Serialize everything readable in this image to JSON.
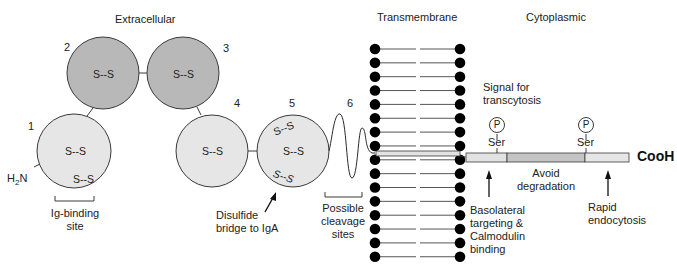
{
  "regions": {
    "extracellular": "Extracellular",
    "transmembrane": "Transmembrane",
    "cytoplasmic": "Cytoplasmic"
  },
  "domains": [
    {
      "number": "1",
      "bonds": [
        "S--S",
        "S--S"
      ],
      "shade": "light"
    },
    {
      "number": "2",
      "bonds": [
        "S--S"
      ],
      "shade": "dark"
    },
    {
      "number": "3",
      "bonds": [
        "S--S"
      ],
      "shade": "dark"
    },
    {
      "number": "4",
      "bonds": [
        "S--S"
      ],
      "shade": "light"
    },
    {
      "number": "5",
      "bonds": [
        "S--S",
        "S--S",
        "S--S"
      ],
      "shade": "light"
    },
    {
      "number": "6",
      "bonds": [],
      "shade": "none"
    }
  ],
  "labels": {
    "n_terminus": "H",
    "n_terminus_sub": "2",
    "n_terminus_tail": "N",
    "ig_binding_1": "Ig-binding",
    "ig_binding_2": "site",
    "disulfide_1": "Disulfide",
    "disulfide_2": "bridge to IgA",
    "cleavage_1": "Possible",
    "cleavage_2": "cleavage",
    "cleavage_3": "sites",
    "signal_1": "Signal for",
    "signal_2": "transcytosis",
    "phospho": "P",
    "ser_1": "Ser",
    "ser_2": "Ser",
    "avoid_1": "Avoid",
    "avoid_2": "degradation",
    "basolateral_1": "Basolateral",
    "basolateral_2": "targeting &",
    "basolateral_3": "Calmodulin",
    "basolateral_4": "binding",
    "rapid_1": "Rapid",
    "rapid_2": "endocytosis",
    "c_terminus": "CooH"
  },
  "membrane": {
    "rows": 16
  },
  "colors": {
    "domain_dark": "#b8b8b8",
    "domain_light": "#e6e6e6",
    "bar_light": "#e2e2e2",
    "bar_dark": "#c4c4c4",
    "outline": "#3a3a3a",
    "lipid_head": "#000000"
  }
}
